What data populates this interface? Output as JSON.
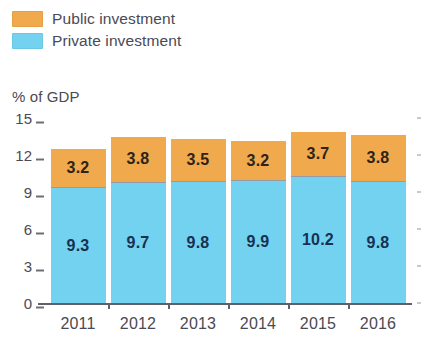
{
  "legend": {
    "items": [
      {
        "label": "Public investment",
        "color": "#f0a94c",
        "swatch_name": "legend-swatch-public"
      },
      {
        "label": "Private investment",
        "color": "#72d2f0",
        "swatch_name": "legend-swatch-private"
      }
    ]
  },
  "axis_title": "% of GDP",
  "chart_data": {
    "type": "bar",
    "stacked": true,
    "title": "",
    "subtitle": "",
    "xlabel": "",
    "ylabel": "% of GDP",
    "categories": [
      "2011",
      "2012",
      "2013",
      "2014",
      "2015",
      "2016"
    ],
    "series": [
      {
        "name": "Private investment",
        "color": "#72d2f0",
        "values": [
          9.3,
          9.7,
          9.8,
          9.9,
          10.2,
          9.8
        ],
        "labels": [
          "9.3",
          "9.7",
          "9.8",
          "9.9",
          "10.2",
          "9.8"
        ]
      },
      {
        "name": "Public investment",
        "color": "#f0a94c",
        "values": [
          3.2,
          3.8,
          3.5,
          3.2,
          3.7,
          3.8
        ],
        "labels": [
          "3.2",
          "3.8",
          "3.5",
          "3.2",
          "3.7",
          "3.8"
        ]
      }
    ],
    "totals": [
      12.5,
      13.5,
      13.3,
      13.1,
      13.9,
      13.6
    ],
    "ylim": [
      0,
      15
    ],
    "yticks": [
      0,
      3,
      6,
      9,
      12,
      15
    ],
    "ytick_labels": [
      "0",
      "3",
      "6",
      "9",
      "12",
      "15"
    ],
    "grid": false,
    "legend_position": "top-left"
  }
}
